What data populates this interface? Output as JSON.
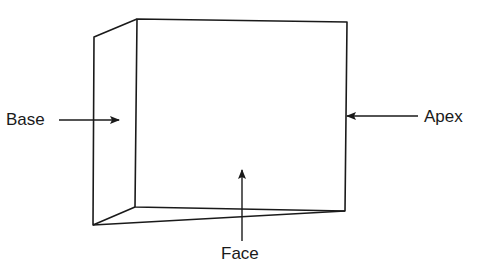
{
  "diagram": {
    "labels": {
      "base": "Base",
      "apex": "Apex",
      "face": "Face"
    },
    "colors": {
      "line": "#1a1a1a",
      "background": "#ffffff"
    }
  }
}
